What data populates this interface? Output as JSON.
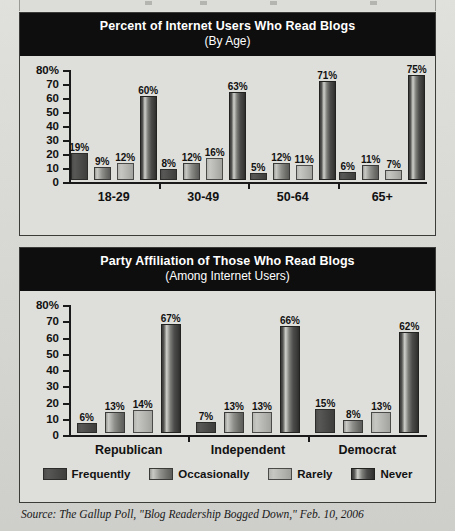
{
  "source_note": "Source: The Gallup Poll, \"Blog Readership Bogged Down,\" Feb. 10, 2006",
  "legend": {
    "items": [
      {
        "label": "Frequently",
        "swatch": "dark-solid-swatch"
      },
      {
        "label": "Occasionally",
        "swatch": "gradient-swatch"
      },
      {
        "label": "Rarely",
        "swatch": "light-gray-swatch"
      },
      {
        "label": "Never",
        "swatch": "cylinder-dark-swatch"
      }
    ]
  },
  "chart_data": [
    {
      "type": "bar",
      "title": "Percent of Internet Users Who Read Blogs",
      "subtitle": "(By Age)",
      "xlabel": "",
      "ylabel": "",
      "ylim": [
        0,
        80
      ],
      "yticks": [
        0,
        10,
        20,
        30,
        40,
        50,
        60,
        70,
        80
      ],
      "ytick_labels": [
        "0",
        "10",
        "20",
        "30",
        "40",
        "50",
        "60",
        "70",
        "80%"
      ],
      "grid": false,
      "legend_position": "bottom",
      "categories": [
        "18-29",
        "30-49",
        "50-64",
        "65+"
      ],
      "series": [
        {
          "name": "Frequently",
          "values": [
            19,
            8,
            5,
            6
          ],
          "labels": [
            "19%",
            "8%",
            "5%",
            "6%"
          ]
        },
        {
          "name": "Occasionally",
          "values": [
            9,
            12,
            12,
            11
          ],
          "labels": [
            "9%",
            "12%",
            "12%",
            "11%"
          ]
        },
        {
          "name": "Rarely",
          "values": [
            12,
            16,
            11,
            7
          ],
          "labels": [
            "12%",
            "16%",
            "11%",
            "7%"
          ]
        },
        {
          "name": "Never",
          "values": [
            60,
            63,
            71,
            75
          ],
          "labels": [
            "60%",
            "63%",
            "71%",
            "75%"
          ]
        }
      ]
    },
    {
      "type": "bar",
      "title": "Party Affiliation of Those Who Read Blogs",
      "subtitle": "(Among Internet Users)",
      "xlabel": "",
      "ylabel": "",
      "ylim": [
        0,
        80
      ],
      "yticks": [
        0,
        10,
        20,
        30,
        40,
        50,
        60,
        70,
        80
      ],
      "ytick_labels": [
        "0",
        "10",
        "20",
        "30",
        "40",
        "50",
        "60",
        "70",
        "80%"
      ],
      "grid": false,
      "legend_position": "bottom",
      "categories": [
        "Republican",
        "Independent",
        "Democrat"
      ],
      "series": [
        {
          "name": "Frequently",
          "values": [
            6,
            7,
            15
          ],
          "labels": [
            "6%",
            "7%",
            "15%"
          ]
        },
        {
          "name": "Occasionally",
          "values": [
            13,
            13,
            8
          ],
          "labels": [
            "13%",
            "13%",
            "8%"
          ]
        },
        {
          "name": "Rarely",
          "values": [
            14,
            13,
            13
          ],
          "labels": [
            "14%",
            "13%",
            "13%"
          ]
        },
        {
          "name": "Never",
          "values": [
            67,
            66,
            62
          ],
          "labels": [
            "67%",
            "66%",
            "62%"
          ]
        }
      ]
    }
  ]
}
